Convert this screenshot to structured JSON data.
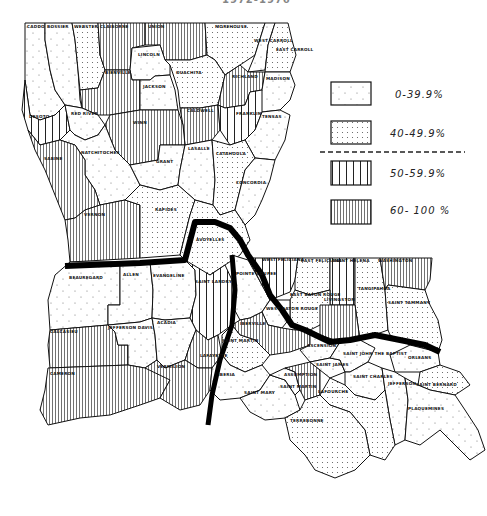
{
  "map": {
    "title": "1972-1976",
    "region": "Louisiana",
    "unit": "parish",
    "legend": [
      {
        "id": "cat1",
        "label": "0-39.9%",
        "pattern": "sparse-dots"
      },
      {
        "id": "cat2",
        "label": "40-49.9%",
        "pattern": "dense-dots"
      },
      {
        "id": "cat3",
        "label": "50-59.9%",
        "pattern": "wide-vertical-lines"
      },
      {
        "id": "cat4",
        "label": "60- 100 %",
        "pattern": "dense-vertical-lines"
      }
    ],
    "parishes": [
      {
        "name": "CADDO",
        "category": "0-39.9%"
      },
      {
        "name": "BOSSIER",
        "category": "0-39.9%"
      },
      {
        "name": "WEBSTER",
        "category": "40-49.9%"
      },
      {
        "name": "CLAIBORNE",
        "category": "60- 100 %"
      },
      {
        "name": "UNION",
        "category": "60- 100 %"
      },
      {
        "name": "MOREHOUSE",
        "category": "40-49.9%"
      },
      {
        "name": "WEST CARROLL",
        "category": "0-39.9%"
      },
      {
        "name": "EAST CARROLL",
        "category": "40-49.9%"
      },
      {
        "name": "LINCOLN",
        "category": "0-39.9%"
      },
      {
        "name": "BIENVILLE",
        "category": "60- 100 %"
      },
      {
        "name": "JACKSON",
        "category": "0-39.9%"
      },
      {
        "name": "OUACHITA",
        "category": "40-49.9%"
      },
      {
        "name": "RICHLAND",
        "category": "60- 100 %"
      },
      {
        "name": "MADISON",
        "category": "0-39.9%"
      },
      {
        "name": "DE SOTO",
        "category": "50-59.9%"
      },
      {
        "name": "RED RIVER",
        "category": "0-39.9%"
      },
      {
        "name": "CALDWELL",
        "category": "60- 100 %"
      },
      {
        "name": "FRANKLIN",
        "category": "50-59.9%"
      },
      {
        "name": "TENSAS",
        "category": "0-39.9%"
      },
      {
        "name": "WINN",
        "category": "60- 100 %"
      },
      {
        "name": "NATCHITOCHES",
        "category": "0-39.9%"
      },
      {
        "name": "SABINE",
        "category": "60- 100 %"
      },
      {
        "name": "GRANT",
        "category": "0-39.9%"
      },
      {
        "name": "LASALLE",
        "category": "0-39.9%"
      },
      {
        "name": "CATAHOULA",
        "category": "40-49.9%"
      },
      {
        "name": "CONCORDIA",
        "category": "0-39.9%"
      },
      {
        "name": "VERNON",
        "category": "60- 100 %"
      },
      {
        "name": "RAPIDES",
        "category": "40-49.9%"
      },
      {
        "name": "AVOYELLES",
        "category": "40-49.9%"
      },
      {
        "name": "BEAUREGARD",
        "category": "0-39.9%"
      },
      {
        "name": "ALLEN",
        "category": "0-39.9%"
      },
      {
        "name": "EVANGELINE",
        "category": "0-39.9%"
      },
      {
        "name": "SAINT LANDRY",
        "category": "50-59.9%"
      },
      {
        "name": "POINTE COUPEE",
        "category": "0-39.9%"
      },
      {
        "name": "WEST FELICIANA",
        "category": "50-59.9%"
      },
      {
        "name": "EAST FELICIANA",
        "category": "40-49.9%"
      },
      {
        "name": "SAINT HELENA",
        "category": "50-59.9%"
      },
      {
        "name": "WASHINGTON",
        "category": "60- 100 %"
      },
      {
        "name": "TANGIPAHOA",
        "category": "40-49.9%"
      },
      {
        "name": "SAINT TAMMANY",
        "category": "40-49.9%"
      },
      {
        "name": "EAST BATON ROUGE",
        "category": "40-49.9%"
      },
      {
        "name": "WEST BATON ROUGE",
        "category": "0-39.9%"
      },
      {
        "name": "LIVINGSTON",
        "category": "60- 100 %"
      },
      {
        "name": "IBERVILLE",
        "category": "60- 100 %"
      },
      {
        "name": "ASCENSION",
        "category": "0-39.9%"
      },
      {
        "name": "CALCASIEU",
        "category": "60- 100 %"
      },
      {
        "name": "JEFFERSON DAVIS",
        "category": "0-39.9%"
      },
      {
        "name": "ACADIA",
        "category": "0-39.9%"
      },
      {
        "name": "LAFAYETTE",
        "category": "60- 100 %"
      },
      {
        "name": "SAINT MARTIN",
        "category": "40-49.9%"
      },
      {
        "name": "CAMERON",
        "category": "60- 100 %"
      },
      {
        "name": "VERMILION",
        "category": "60- 100 %"
      },
      {
        "name": "IBERIA",
        "category": "0-39.9%"
      },
      {
        "name": "SAINT MARY",
        "category": "0-39.9%"
      },
      {
        "name": "SAINT MARTIN (2)",
        "category": "0-39.9%"
      },
      {
        "name": "ASSUMPTION",
        "category": "60- 100 %"
      },
      {
        "name": "SAINT JAMES",
        "category": "0-39.9%"
      },
      {
        "name": "SAINT JOHN THE BAPTIST",
        "category": "0-39.9%"
      },
      {
        "name": "SAINT CHARLES",
        "category": "0-39.9%"
      },
      {
        "name": "ORLEANS",
        "category": "0-39.9%"
      },
      {
        "name": "JEFFERSON",
        "category": "0-39.9%"
      },
      {
        "name": "SAINT BERNARD",
        "category": "40-49.9%"
      },
      {
        "name": "LAFOURCHE",
        "category": "40-49.9%"
      },
      {
        "name": "TERREBONNE",
        "category": "40-49.9%"
      },
      {
        "name": "PLAQUEMINES",
        "category": "0-39.9%"
      }
    ],
    "labels": {
      "caddo": "CADDO",
      "bossier": "BOSSIER",
      "webster": "WEBSTER",
      "claiborne": "CLAIBORNE",
      "union": "UNION",
      "morehouse": "MOREHOUSE",
      "west_carroll": "WEST CARROLL",
      "east_carroll": "EAST CARROLL",
      "lincoln": "LINCOLN",
      "bienville": "BIENVILLE",
      "jackson": "JACKSON",
      "ouachita": "OUACHITA",
      "richland": "RICHLAND",
      "madison": "MADISON",
      "desoto": "DESOTO",
      "red_river": "RED RIVER",
      "caldwell": "CALDWELL",
      "franklin": "FRANKLIN",
      "tensas": "TENSAS",
      "winn": "WINN",
      "natchitoches": "NATCHITOCHES",
      "sabine": "SABINE",
      "grant": "GRANT",
      "lasalle": "LASALLE",
      "catahoula": "CATAHOULA",
      "concordia": "CONCORDIA",
      "vernon": "VERNON",
      "rapides": "RAPIDES",
      "avoyelles": "AVOYELLES",
      "beauregard": "BEAUREGARD",
      "allen": "ALLEN",
      "evangeline": "EVANGELINE",
      "saint_landry": "SAINT LANDRY",
      "pointe_coupee": "POINTE COUPEE",
      "west_feliciana": "WEST FELICIANA",
      "east_feliciana": "EAST FELICIANA",
      "saint_helena": "SAINT HELENA",
      "washington": "WASHINGTON",
      "tangipahoa": "TANGIPAHOA",
      "saint_tammany": "SAINT TAMMANY",
      "east_baton_rouge": "EAST BATON ROUGE",
      "west_baton_rouge": "WEST BATON ROUGE",
      "livingston": "LIVINGSTON",
      "iberville": "IBERVILLE",
      "ascension": "ASCENSION",
      "calcasieu": "CALCASIEU",
      "jefferson_davis": "JEFFERSON DAVIS",
      "acadia": "ACADIA",
      "lafayette": "LAFAYETTE",
      "saint_martin": "SAINT MARTIN",
      "cameron": "CAMERON",
      "vermilion": "VERMILION",
      "iberia": "IBERIA",
      "saint_mary": "SAINT MARY",
      "saint_martin_2": "SAINT MARTIN",
      "assumption": "ASSUMPTION",
      "saint_james": "SAINT JAMES",
      "saint_john": "SAINT JOHN THE BAPTIST",
      "saint_charles": "SAINT CHARLES",
      "orleans": "ORLEANS",
      "jefferson": "JEFFERSON",
      "saint_bernard": "SAINT BERNARD",
      "lafourche": "LAFOURCHE",
      "terrebonne": "TERREBONNE",
      "plaquemines": "PLAQUEMINES"
    }
  }
}
